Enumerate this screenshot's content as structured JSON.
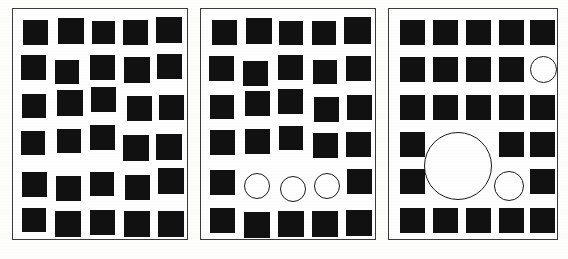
{
  "figure": {
    "background_color": "#fdfdfc",
    "square_color": "#111111",
    "circle_fill_color": "#fefefe",
    "circle_stroke_color": "#1a1a1a",
    "panel_border_color": "#3a3a3a",
    "caption_text": ""
  },
  "panels": [
    {
      "name": "panel-left",
      "label": "Panel 1",
      "x": 12,
      "y": 8,
      "width": 176,
      "height": 232,
      "rows": 6,
      "columns": 5,
      "square_count": 30,
      "circle_count": 0,
      "jitter": "high",
      "shapes": [
        {
          "type": "square",
          "x": 10,
          "y": 11,
          "w": 25,
          "h": 25
        },
        {
          "type": "square",
          "x": 45,
          "y": 9,
          "w": 26,
          "h": 26
        },
        {
          "type": "square",
          "x": 79,
          "y": 12,
          "w": 23,
          "h": 23
        },
        {
          "type": "square",
          "x": 110,
          "y": 11,
          "w": 25,
          "h": 25
        },
        {
          "type": "square",
          "x": 143,
          "y": 8,
          "w": 26,
          "h": 26
        },
        {
          "type": "square",
          "x": 8,
          "y": 46,
          "w": 25,
          "h": 25
        },
        {
          "type": "square",
          "x": 42,
          "y": 51,
          "w": 24,
          "h": 24
        },
        {
          "type": "square",
          "x": 77,
          "y": 46,
          "w": 25,
          "h": 25
        },
        {
          "type": "square",
          "x": 111,
          "y": 48,
          "w": 26,
          "h": 26
        },
        {
          "type": "square",
          "x": 144,
          "y": 45,
          "w": 25,
          "h": 25
        },
        {
          "type": "square",
          "x": 9,
          "y": 85,
          "w": 24,
          "h": 24
        },
        {
          "type": "square",
          "x": 44,
          "y": 81,
          "w": 26,
          "h": 26
        },
        {
          "type": "square",
          "x": 78,
          "y": 78,
          "w": 25,
          "h": 25
        },
        {
          "type": "square",
          "x": 114,
          "y": 87,
          "w": 25,
          "h": 25
        },
        {
          "type": "square",
          "x": 146,
          "y": 86,
          "w": 25,
          "h": 25
        },
        {
          "type": "square",
          "x": 8,
          "y": 122,
          "w": 24,
          "h": 24
        },
        {
          "type": "square",
          "x": 44,
          "y": 120,
          "w": 24,
          "h": 24
        },
        {
          "type": "square",
          "x": 77,
          "y": 116,
          "w": 25,
          "h": 25
        },
        {
          "type": "square",
          "x": 110,
          "y": 126,
          "w": 26,
          "h": 26
        },
        {
          "type": "square",
          "x": 143,
          "y": 125,
          "w": 26,
          "h": 26
        },
        {
          "type": "square",
          "x": 9,
          "y": 163,
          "w": 25,
          "h": 25
        },
        {
          "type": "square",
          "x": 43,
          "y": 167,
          "w": 25,
          "h": 25
        },
        {
          "type": "square",
          "x": 77,
          "y": 163,
          "w": 24,
          "h": 24
        },
        {
          "type": "square",
          "x": 112,
          "y": 166,
          "w": 25,
          "h": 25
        },
        {
          "type": "square",
          "x": 145,
          "y": 159,
          "w": 26,
          "h": 26
        },
        {
          "type": "square",
          "x": 9,
          "y": 199,
          "w": 24,
          "h": 24
        },
        {
          "type": "square",
          "x": 42,
          "y": 202,
          "w": 26,
          "h": 26
        },
        {
          "type": "square",
          "x": 77,
          "y": 201,
          "w": 25,
          "h": 25
        },
        {
          "type": "square",
          "x": 111,
          "y": 202,
          "w": 26,
          "h": 26
        },
        {
          "type": "square",
          "x": 145,
          "y": 202,
          "w": 26,
          "h": 26
        }
      ]
    },
    {
      "name": "panel-middle",
      "label": "Panel 2",
      "x": 200,
      "y": 8,
      "width": 176,
      "height": 232,
      "rows": 6,
      "columns": 5,
      "square_count": 27,
      "circle_count": 3,
      "jitter": "medium",
      "shapes": [
        {
          "type": "square",
          "x": 11,
          "y": 11,
          "w": 25,
          "h": 25
        },
        {
          "type": "square",
          "x": 45,
          "y": 9,
          "w": 26,
          "h": 26
        },
        {
          "type": "square",
          "x": 78,
          "y": 12,
          "w": 24,
          "h": 24
        },
        {
          "type": "square",
          "x": 111,
          "y": 12,
          "w": 24,
          "h": 24
        },
        {
          "type": "square",
          "x": 143,
          "y": 8,
          "w": 27,
          "h": 27
        },
        {
          "type": "square",
          "x": 8,
          "y": 47,
          "w": 25,
          "h": 25
        },
        {
          "type": "square",
          "x": 42,
          "y": 52,
          "w": 25,
          "h": 25
        },
        {
          "type": "square",
          "x": 77,
          "y": 46,
          "w": 25,
          "h": 25
        },
        {
          "type": "square",
          "x": 112,
          "y": 51,
          "w": 24,
          "h": 24
        },
        {
          "type": "square",
          "x": 145,
          "y": 47,
          "w": 25,
          "h": 25
        },
        {
          "type": "square",
          "x": 9,
          "y": 86,
          "w": 24,
          "h": 24
        },
        {
          "type": "square",
          "x": 44,
          "y": 82,
          "w": 25,
          "h": 25
        },
        {
          "type": "square",
          "x": 77,
          "y": 80,
          "w": 25,
          "h": 25
        },
        {
          "type": "square",
          "x": 113,
          "y": 88,
          "w": 25,
          "h": 25
        },
        {
          "type": "square",
          "x": 146,
          "y": 86,
          "w": 25,
          "h": 25
        },
        {
          "type": "square",
          "x": 9,
          "y": 121,
          "w": 25,
          "h": 25
        },
        {
          "type": "square",
          "x": 44,
          "y": 120,
          "w": 25,
          "h": 25
        },
        {
          "type": "square",
          "x": 78,
          "y": 117,
          "w": 24,
          "h": 24
        },
        {
          "type": "square",
          "x": 112,
          "y": 124,
          "w": 25,
          "h": 25
        },
        {
          "type": "square",
          "x": 145,
          "y": 123,
          "w": 25,
          "h": 25
        },
        {
          "type": "square",
          "x": 9,
          "y": 161,
          "w": 25,
          "h": 25
        },
        {
          "type": "circle",
          "x": 43,
          "y": 164,
          "w": 26,
          "h": 26
        },
        {
          "type": "circle",
          "x": 79,
          "y": 167,
          "w": 26,
          "h": 26
        },
        {
          "type": "circle",
          "x": 113,
          "y": 164,
          "w": 26,
          "h": 26
        },
        {
          "type": "square",
          "x": 146,
          "y": 160,
          "w": 25,
          "h": 25
        },
        {
          "type": "square",
          "x": 9,
          "y": 199,
          "w": 25,
          "h": 25
        },
        {
          "type": "square",
          "x": 43,
          "y": 203,
          "w": 26,
          "h": 26
        },
        {
          "type": "square",
          "x": 77,
          "y": 202,
          "w": 26,
          "h": 26
        },
        {
          "type": "square",
          "x": 111,
          "y": 202,
          "w": 26,
          "h": 26
        },
        {
          "type": "square",
          "x": 145,
          "y": 201,
          "w": 26,
          "h": 26
        }
      ]
    },
    {
      "name": "panel-right",
      "label": "Panel 3",
      "x": 388,
      "y": 8,
      "width": 170,
      "height": 232,
      "rows": 6,
      "columns": 5,
      "square_count": 26,
      "circle_count": 3,
      "jitter": "none",
      "shapes": [
        {
          "type": "square",
          "x": 11,
          "y": 11,
          "w": 25,
          "h": 25
        },
        {
          "type": "square",
          "x": 44,
          "y": 11,
          "w": 25,
          "h": 25
        },
        {
          "type": "square",
          "x": 77,
          "y": 11,
          "w": 25,
          "h": 25
        },
        {
          "type": "square",
          "x": 110,
          "y": 11,
          "w": 25,
          "h": 25
        },
        {
          "type": "square",
          "x": 141,
          "y": 11,
          "w": 25,
          "h": 25
        },
        {
          "type": "square",
          "x": 11,
          "y": 48,
          "w": 25,
          "h": 25
        },
        {
          "type": "square",
          "x": 44,
          "y": 48,
          "w": 25,
          "h": 25
        },
        {
          "type": "square",
          "x": 77,
          "y": 48,
          "w": 25,
          "h": 25
        },
        {
          "type": "square",
          "x": 110,
          "y": 48,
          "w": 25,
          "h": 25
        },
        {
          "type": "circle",
          "x": 141,
          "y": 47,
          "w": 27,
          "h": 27
        },
        {
          "type": "square",
          "x": 11,
          "y": 86,
          "w": 25,
          "h": 25
        },
        {
          "type": "square",
          "x": 44,
          "y": 86,
          "w": 25,
          "h": 25
        },
        {
          "type": "square",
          "x": 77,
          "y": 86,
          "w": 25,
          "h": 25
        },
        {
          "type": "square",
          "x": 110,
          "y": 86,
          "w": 25,
          "h": 25
        },
        {
          "type": "square",
          "x": 141,
          "y": 86,
          "w": 25,
          "h": 25
        },
        {
          "type": "square",
          "x": 11,
          "y": 123,
          "w": 25,
          "h": 25
        },
        {
          "type": "circle",
          "x": 35,
          "y": 123,
          "w": 68,
          "h": 68
        },
        {
          "type": "square",
          "x": 110,
          "y": 123,
          "w": 25,
          "h": 25
        },
        {
          "type": "square",
          "x": 141,
          "y": 123,
          "w": 25,
          "h": 25
        },
        {
          "type": "square",
          "x": 11,
          "y": 160,
          "w": 25,
          "h": 25
        },
        {
          "type": "circle",
          "x": 105,
          "y": 162,
          "w": 30,
          "h": 30
        },
        {
          "type": "square",
          "x": 141,
          "y": 160,
          "w": 25,
          "h": 25
        },
        {
          "type": "square",
          "x": 11,
          "y": 199,
          "w": 25,
          "h": 25
        },
        {
          "type": "square",
          "x": 44,
          "y": 199,
          "w": 25,
          "h": 25
        },
        {
          "type": "square",
          "x": 77,
          "y": 199,
          "w": 25,
          "h": 25
        },
        {
          "type": "square",
          "x": 110,
          "y": 199,
          "w": 25,
          "h": 25
        },
        {
          "type": "square",
          "x": 141,
          "y": 199,
          "w": 25,
          "h": 25
        }
      ]
    }
  ]
}
